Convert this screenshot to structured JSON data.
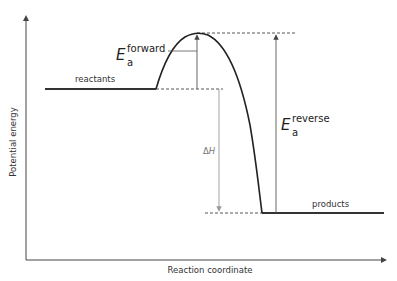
{
  "diagram": {
    "axes": {
      "x_label": "Reaction coordinate",
      "y_label": "Potential energy"
    },
    "levels": {
      "reactants_label": "reactants",
      "products_label": "products"
    },
    "annotations": {
      "ea_forward": {
        "symbol": "E",
        "subscript": "a",
        "superscript": "forward"
      },
      "ea_reverse": {
        "symbol": "E",
        "subscript": "a",
        "superscript": "reverse"
      },
      "delta_h": {
        "delta": "Δ",
        "symbol": "H"
      }
    },
    "colors": {
      "curve": "#222222",
      "axis": "#444444",
      "dashed": "#444444",
      "delta_h_arrow": "#999999",
      "arrows": "#555555"
    }
  }
}
